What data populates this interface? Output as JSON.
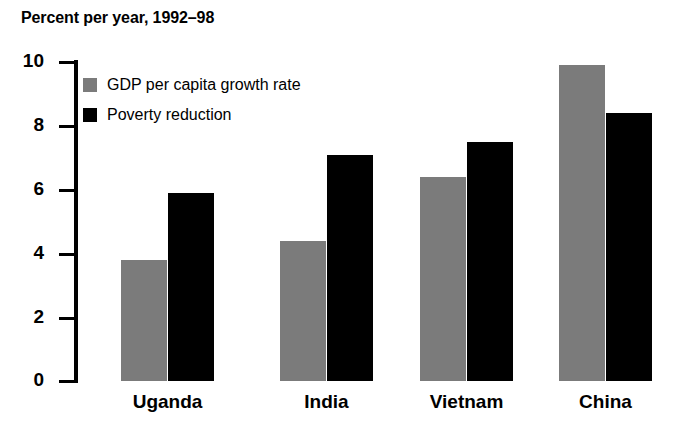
{
  "chart_data": {
    "type": "bar",
    "title": "Percent per year, 1992–98",
    "xlabel": "",
    "ylabel": "",
    "ylim": [
      0,
      10
    ],
    "yticks": [
      0,
      2,
      4,
      6,
      8,
      10
    ],
    "ytick_labels": [
      "0",
      "2",
      "4",
      "6",
      "8",
      "10"
    ],
    "grid": false,
    "legend_position": "top-left inside plot",
    "categories": [
      "Uganda",
      "India",
      "Vietnam",
      "China"
    ],
    "series": [
      {
        "name": "GDP per capita growth rate",
        "color": "#7b7b7b",
        "values": [
          3.8,
          4.4,
          6.4,
          9.9
        ]
      },
      {
        "name": "Poverty reduction",
        "color": "#000000",
        "values": [
          5.9,
          7.1,
          7.5,
          8.4
        ]
      }
    ]
  },
  "legend": {
    "items": [
      {
        "label": "GDP per capita growth rate",
        "color": "#7b7b7b"
      },
      {
        "label": "Poverty reduction",
        "color": "#000000"
      }
    ]
  },
  "colors": {
    "gdp": "#7b7b7b",
    "poverty": "#000000",
    "axis": "#000000",
    "background": "#ffffff"
  }
}
